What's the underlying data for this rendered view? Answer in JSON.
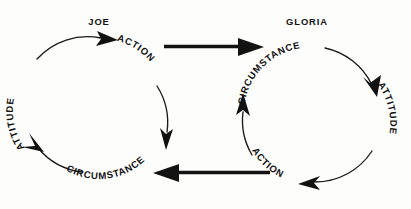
{
  "diagram": {
    "background_color": "#fdfdfc",
    "ink_color": "#121212",
    "cycles": [
      {
        "id": "joe",
        "person_label": "JOE",
        "direction": "clockwise",
        "center_x": 103,
        "center_y": 105,
        "radius": 68,
        "nodes": [
          {
            "id": "joe-attitude",
            "label": "ATTITUDE",
            "position": "left"
          },
          {
            "id": "joe-action",
            "label": "ACTION",
            "position": "top-right"
          },
          {
            "id": "joe-circumstance",
            "label": "CIRCUMSTANCE",
            "position": "bottom"
          }
        ]
      },
      {
        "id": "gloria",
        "person_label": "GLORIA",
        "direction": "clockwise",
        "center_x": 308,
        "center_y": 115,
        "radius": 68,
        "nodes": [
          {
            "id": "gloria-circumstance",
            "label": "CIRCUMSTANCE",
            "position": "top-left"
          },
          {
            "id": "gloria-attitude",
            "label": "ATTITUDE",
            "position": "right"
          },
          {
            "id": "gloria-action",
            "label": "ACTION",
            "position": "bottom-left"
          }
        ]
      }
    ],
    "connectors": [
      {
        "id": "joe-action-to-gloria-circumstance",
        "from": "joe-action",
        "to": "gloria-circumstance",
        "direction": "right",
        "style": "thick-straight-arrow"
      },
      {
        "id": "gloria-action-to-joe-circumstance",
        "from": "gloria-action",
        "to": "joe-circumstance",
        "direction": "left",
        "style": "thick-straight-arrow"
      }
    ]
  }
}
